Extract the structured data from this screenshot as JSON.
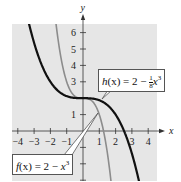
{
  "chart_data": {
    "type": "line",
    "title": "",
    "xlabel": "x",
    "ylabel": "y",
    "xlim": [
      -4.5,
      4.5
    ],
    "ylim": [
      -3,
      6.8
    ],
    "x_ticks": [
      -4,
      -3,
      -2,
      -1,
      1,
      2,
      3,
      4
    ],
    "x_tick_labels": [
      "-4",
      "-3",
      "-2",
      "-1",
      "1",
      "2",
      "3",
      "4"
    ],
    "y_ticks": [
      1,
      2,
      3,
      4,
      5,
      6
    ],
    "y_tick_labels": [
      "1",
      "",
      "3",
      "4",
      "5",
      "6"
    ],
    "grid": false,
    "background": "#e6e6e6",
    "series": [
      {
        "name": "f(x) = 2 − x³",
        "formula": "2 - x^3",
        "color": "#8c8c8c",
        "x": [
          -1.7,
          -1.5,
          -1,
          -0.5,
          0,
          0.5,
          1,
          1.5,
          2.1
        ],
        "values": [
          6.91,
          5.375,
          3,
          2.125,
          2,
          1.875,
          1,
          -1.375,
          -7.26
        ]
      },
      {
        "name": "h(x) = 2 − (1/8)x³",
        "formula": "2 - x^3/8",
        "color": "#111111",
        "x": [
          -3.4,
          -3,
          -2,
          -1,
          0,
          1,
          2,
          3,
          3.4
        ],
        "values": [
          6.91,
          5.375,
          3,
          2.125,
          2,
          1.875,
          1,
          -1.375,
          -2.91
        ]
      }
    ],
    "annotations": [
      {
        "text": "h(x) = 2 − ⅛x³",
        "target_series": "h"
      },
      {
        "text": "f(x) = 2 − x³",
        "target_series": "f"
      }
    ]
  },
  "labels": {
    "h_name": "h",
    "h_paren": "(x) = 2 − ",
    "h_frac": "1/8",
    "h_var": "x",
    "h_exp": "3",
    "f_name": "f",
    "f_paren": "(x) = 2 − ",
    "f_var": "x",
    "f_exp": "3",
    "x_axis": "x",
    "y_axis": "y"
  }
}
